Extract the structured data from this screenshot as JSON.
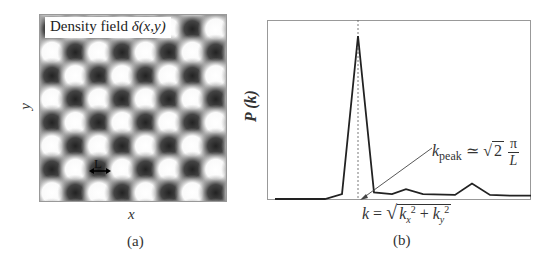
{
  "figure": {
    "panel_a": {
      "label": "Density field",
      "label_math": "δ(x,y)",
      "length_marker": "L",
      "x_axis_label": "x",
      "y_axis_label": "y",
      "caption": "(a)",
      "pattern": {
        "type": "checkerboard",
        "cell_px": 23.4,
        "columns": 8,
        "rows": 8,
        "dark_color": "#2a2a2a",
        "light_color": "#ffffff"
      }
    },
    "panel_b": {
      "y_axis_label": "P (k)",
      "x_axis_label_lhs": "k",
      "x_axis_label_rhs": "k_x^2 + k_y^2",
      "annotation_lhs": "k",
      "annotation_sub": "peak",
      "annotation_rel": "≃",
      "annotation_sqrt": "2",
      "annotation_num": "π",
      "annotation_den": "L",
      "caption": "(b)"
    }
  },
  "chart_data": [
    {
      "type": "heatmap",
      "title": "Density field δ(x,y)",
      "xlabel": "x",
      "ylabel": "y",
      "description": "Sinusoidal checkerboard density pattern with period L between adjacent extrema",
      "annotations": [
        "L"
      ]
    },
    {
      "type": "line",
      "title": "",
      "xlabel": "k = sqrt(k_x^2 + k_y^2)",
      "ylabel": "P(k)",
      "x": [
        0,
        1,
        2,
        3,
        4,
        5,
        6,
        7,
        8,
        9,
        10,
        11,
        12
      ],
      "values": [
        0.0,
        0.0,
        0.03,
        1.0,
        0.04,
        0.03,
        0.06,
        0.03,
        0.025,
        0.095,
        0.025,
        0.02,
        0.02
      ],
      "grid": false,
      "annotations": [
        "k_peak ≃ √2 π / L (dashed vertical line at peak)"
      ],
      "ylim": [
        0,
        1.03
      ]
    }
  ]
}
